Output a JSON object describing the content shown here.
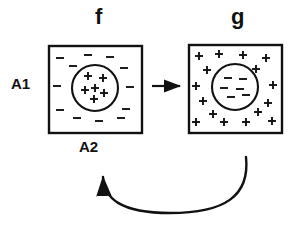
{
  "figure": {
    "type": "diagram",
    "labels": {
      "left_box_title": "f",
      "right_box_title": "g",
      "left_row_label": "A1",
      "bottom_label": "A2"
    },
    "colors": {
      "ink": "#111111",
      "background": "#ffffff"
    },
    "boxes": [
      {
        "id": "box-f",
        "title": "f",
        "x": 48,
        "y": 45,
        "w": 93,
        "h": 87,
        "circle": {
          "cx": 95,
          "cy": 88,
          "r": 23
        },
        "inside_sign": "+",
        "outside_sign": "-",
        "inside_count": 6,
        "outside_count": 12,
        "inside_marks": [
          {
            "x": 88,
            "y": 76
          },
          {
            "x": 103,
            "y": 78
          },
          {
            "x": 95,
            "y": 88
          },
          {
            "x": 85,
            "y": 90
          },
          {
            "x": 104,
            "y": 93
          },
          {
            "x": 94,
            "y": 99
          }
        ],
        "outside_marks": [
          {
            "x": 60,
            "y": 58
          },
          {
            "x": 88,
            "y": 55
          },
          {
            "x": 110,
            "y": 57
          },
          {
            "x": 73,
            "y": 66
          },
          {
            "x": 124,
            "y": 68
          },
          {
            "x": 57,
            "y": 86
          },
          {
            "x": 130,
            "y": 87
          },
          {
            "x": 60,
            "y": 110
          },
          {
            "x": 126,
            "y": 109
          },
          {
            "x": 77,
            "y": 118
          },
          {
            "x": 99,
            "y": 121
          },
          {
            "x": 121,
            "y": 118
          }
        ]
      },
      {
        "id": "box-g",
        "title": "g",
        "x": 188,
        "y": 44,
        "w": 93,
        "h": 88,
        "circle": {
          "cx": 235,
          "cy": 87,
          "r": 23
        },
        "inside_sign": "-",
        "outside_sign": "+",
        "inside_count": 6,
        "outside_count": 16,
        "inside_marks": [
          {
            "x": 228,
            "y": 78
          },
          {
            "x": 243,
            "y": 79
          },
          {
            "x": 224,
            "y": 88
          },
          {
            "x": 240,
            "y": 89
          },
          {
            "x": 231,
            "y": 97
          },
          {
            "x": 246,
            "y": 95
          }
        ],
        "outside_marks": [
          {
            "x": 199,
            "y": 56
          },
          {
            "x": 219,
            "y": 54
          },
          {
            "x": 243,
            "y": 55
          },
          {
            "x": 266,
            "y": 58
          },
          {
            "x": 207,
            "y": 70
          },
          {
            "x": 256,
            "y": 69
          },
          {
            "x": 196,
            "y": 86
          },
          {
            "x": 273,
            "y": 85
          },
          {
            "x": 203,
            "y": 101
          },
          {
            "x": 268,
            "y": 103
          },
          {
            "x": 213,
            "y": 114
          },
          {
            "x": 258,
            "y": 112
          },
          {
            "x": 196,
            "y": 122
          },
          {
            "x": 224,
            "y": 122
          },
          {
            "x": 246,
            "y": 122
          },
          {
            "x": 272,
            "y": 121
          }
        ]
      }
    ],
    "arrows": [
      {
        "id": "forward-arrow",
        "kind": "straight",
        "from": "box-f",
        "to": "box-g",
        "x1": 152,
        "y1": 86,
        "x2": 180,
        "y2": 86
      },
      {
        "id": "feedback-arrow",
        "kind": "curved",
        "from": "box-g",
        "to": "A2",
        "head_x": 103,
        "head_y": 169
      }
    ]
  }
}
